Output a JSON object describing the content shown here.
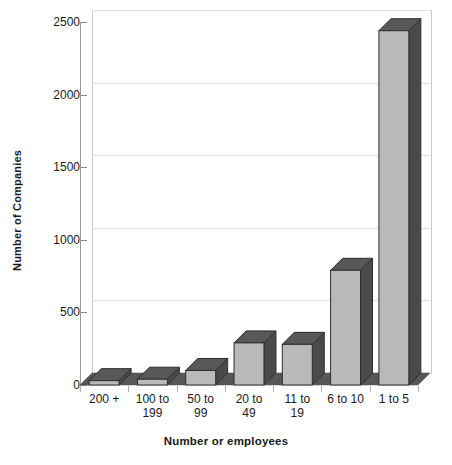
{
  "chart_data": {
    "type": "bar",
    "title": "",
    "xlabel": "Number or employees",
    "ylabel": "Number of Companies",
    "categories": [
      "200 +",
      "100 to 199",
      "50 to 99",
      "20 to 49",
      "11 to 19",
      "6 to 10",
      "1 to 5"
    ],
    "values": [
      30,
      40,
      100,
      290,
      280,
      790,
      2440
    ],
    "ylim": [
      0,
      2500
    ],
    "yticks": [
      0,
      500,
      1000,
      1500,
      2000,
      2500
    ],
    "ytick_labels": [
      "0",
      "500",
      "1000",
      "1500",
      "2000",
      "2500"
    ],
    "grid": true,
    "legend": "none",
    "style": "3d-column",
    "colors": {
      "bar_front": "#b9b9b9",
      "bar_side": "#4a4a4a",
      "bar_top": "#585858",
      "bar_outline": "#2e2e2e",
      "floor": "#575757",
      "gridline": "#dddddd",
      "axis": "#9a9a9a",
      "text": "#1a1a1a",
      "background": "#ffffff"
    }
  },
  "axis": {
    "y_title": "Number of Companies",
    "x_title": "Number or employees"
  },
  "x_labels": [
    {
      "line1": "200 +",
      "line2": ""
    },
    {
      "line1": "100 to",
      "line2": "199"
    },
    {
      "line1": "50 to",
      "line2": "99"
    },
    {
      "line1": "20 to",
      "line2": "49"
    },
    {
      "line1": "11 to",
      "line2": "19"
    },
    {
      "line1": "6 to 10",
      "line2": ""
    },
    {
      "line1": "1 to 5",
      "line2": ""
    }
  ]
}
